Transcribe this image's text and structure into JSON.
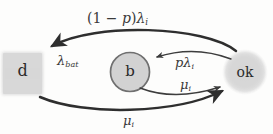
{
  "figure": {
    "kind": "state-transition-diagram",
    "background_color": "#fdfdfc",
    "ink_color": "#2b2b2b",
    "node_fill_color": "#d6d6d6",
    "node_outline_color": "#6b6b6b"
  },
  "nodes": [
    {
      "id": "d",
      "label": "d",
      "shape": "rectangle",
      "x": 22,
      "y": 73,
      "width": 41,
      "height": 43,
      "fill": "#d8d8d8",
      "outlined": false
    },
    {
      "id": "b",
      "label": "b",
      "shape": "circle",
      "x": 130,
      "y": 72,
      "radius": 19,
      "fill": "#d4d4d4",
      "outlined": true
    },
    {
      "id": "ok",
      "label": "ok",
      "shape": "circle-soft",
      "x": 245,
      "y": 72,
      "radius": 22,
      "fill": "#d9d9d9",
      "outlined": false
    }
  ],
  "edges": [
    {
      "id": "ok-to-d-top",
      "from": "ok",
      "to": "d",
      "style": "solid-thick",
      "curve": "arc-over-top",
      "label_plain": "(1 - p)λᵢ",
      "label_parts": {
        "prefix": "(1 − ",
        "var": "p",
        "suffix": ")",
        "rate": "λ",
        "sub": "i"
      }
    },
    {
      "id": "b-to-d-dashed",
      "from": "b",
      "to": "d",
      "style": "dashed-thin",
      "curve": "straight-horizontal",
      "label_plain": "λ_bat",
      "label_parts": {
        "rate": "λ",
        "sub": "bat"
      }
    },
    {
      "id": "ok-to-b",
      "from": "ok",
      "to": "b",
      "style": "solid-thin",
      "curve": "arc-slight-upper",
      "label_plain": "pλᵢ",
      "label_parts": {
        "var": "p",
        "rate": "λ",
        "sub": "i"
      }
    },
    {
      "id": "b-to-ok",
      "from": "b",
      "to": "ok",
      "style": "solid-thin",
      "curve": "arc-slight-lower",
      "label_plain": "μᵢ",
      "label_parts": {
        "rate": "μ",
        "sub": "i"
      }
    },
    {
      "id": "d-to-ok-bottom",
      "from": "d",
      "to": "ok",
      "style": "solid-thick",
      "curve": "arc-under-bottom",
      "label_plain": "μᵢ",
      "label_parts": {
        "rate": "μ",
        "sub": "i"
      }
    }
  ],
  "labels": {
    "node_d": "d",
    "node_b": "b",
    "node_ok": "ok",
    "edge_top_prefix": "(1 − ",
    "edge_top_var": "p",
    "edge_top_close": ")",
    "edge_top_rate": "λ",
    "edge_top_sub": "i",
    "edge_bat_rate": "λ",
    "edge_bat_sub": "bat",
    "edge_plambda_var": "p",
    "edge_plambda_rate": "λ",
    "edge_plambda_sub": "i",
    "edge_mu_mid_rate": "μ",
    "edge_mu_mid_sub": "i",
    "edge_mu_bottom_rate": "μ",
    "edge_mu_bottom_sub": "i"
  }
}
